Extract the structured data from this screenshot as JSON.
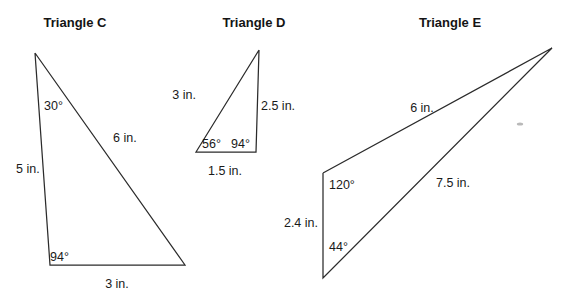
{
  "figure": {
    "width": 571,
    "height": 300,
    "background_color": "#ffffff",
    "stroke_color": "#2b2b2b",
    "text_color": "#1a1a1a",
    "unit": "in."
  },
  "triangles": [
    {
      "id": "triangle-c",
      "title": "Triangle C",
      "title_x": 75,
      "title_y": 27,
      "points": "35,53 50,265 185,265 35,53",
      "sides": [
        {
          "name": "side-left",
          "label": "5 in.",
          "x": 16,
          "y": 173,
          "anchor": "start"
        },
        {
          "name": "side-hyp",
          "label": "6 in.",
          "x": 113,
          "y": 142,
          "anchor": "start"
        },
        {
          "name": "side-base",
          "label": "3 in.",
          "x": 117,
          "y": 288,
          "anchor": "middle"
        }
      ],
      "angles": [
        {
          "name": "angle-apex",
          "label": "30°",
          "x": 44,
          "y": 110,
          "anchor": "start"
        },
        {
          "name": "angle-bottom-left",
          "label": "94°",
          "x": 50,
          "y": 261,
          "anchor": "start"
        }
      ]
    },
    {
      "id": "triangle-d",
      "title": "Triangle D",
      "title_x": 254,
      "title_y": 27,
      "points": "259,50 196,152 256,152 259,50",
      "sides": [
        {
          "name": "side-left",
          "label": "3 in.",
          "x": 196,
          "y": 99,
          "anchor": "end"
        },
        {
          "name": "side-right",
          "label": "2.5 in.",
          "x": 261,
          "y": 110,
          "anchor": "start"
        },
        {
          "name": "side-base",
          "label": "1.5 in.",
          "x": 225,
          "y": 175,
          "anchor": "middle"
        }
      ],
      "angles": [
        {
          "name": "angle-bottom-left",
          "label": "56°",
          "x": 202,
          "y": 148,
          "anchor": "start"
        },
        {
          "name": "angle-bottom-right",
          "label": "94°",
          "x": 231,
          "y": 148,
          "anchor": "start"
        }
      ]
    },
    {
      "id": "triangle-e",
      "title": "Triangle E",
      "title_x": 450,
      "title_y": 27,
      "points": "323,173 552,48 323,278 323,173",
      "sides": [
        {
          "name": "side-upper",
          "label": "6 in.",
          "x": 422,
          "y": 112,
          "anchor": "middle"
        },
        {
          "name": "side-lower",
          "label": "7.5 in.",
          "x": 453,
          "y": 187,
          "anchor": "middle"
        },
        {
          "name": "side-left",
          "label": "2.4 in.",
          "x": 318,
          "y": 227,
          "anchor": "end"
        }
      ],
      "angles": [
        {
          "name": "angle-top-left",
          "label": "120°",
          "x": 329,
          "y": 189,
          "anchor": "start"
        },
        {
          "name": "angle-bottom-left",
          "label": "44°",
          "x": 329,
          "y": 251,
          "anchor": "start"
        }
      ]
    }
  ],
  "artifacts": [
    {
      "name": "scan-speck",
      "x": 520,
      "y": 124,
      "rx": 3.2,
      "ry": 1.6
    }
  ]
}
